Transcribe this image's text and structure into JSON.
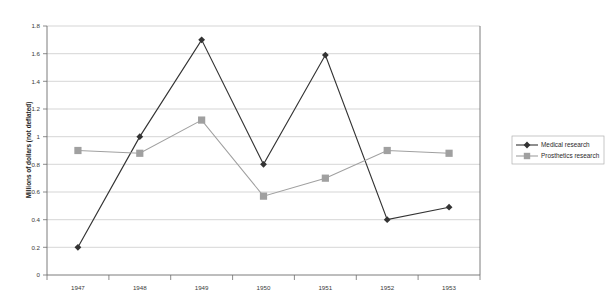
{
  "chart_data": {
    "type": "line",
    "title": "",
    "xlabel": "",
    "ylabel": "Millions of dollars (not deflated)",
    "categories": [
      "1947",
      "1948",
      "1949",
      "1950",
      "1951",
      "1952",
      "1953"
    ],
    "series": [
      {
        "name": "Medical research",
        "color": "#333333",
        "marker": "diamond",
        "values": [
          0.2,
          1.0,
          1.7,
          0.8,
          1.59,
          0.4,
          0.49
        ]
      },
      {
        "name": "Prosthetics research",
        "color": "#a0a0a0",
        "marker": "square",
        "values": [
          0.9,
          0.88,
          1.12,
          0.57,
          0.7,
          0.9,
          0.88
        ]
      }
    ],
    "ylim": [
      0,
      1.8
    ],
    "yticks": [
      "0",
      "0.2",
      "0.4",
      "0.6",
      "0.8",
      "1",
      "1.2",
      "1.4",
      "1.6",
      "1.8"
    ],
    "grid": true,
    "legend_position": "right"
  },
  "legend": {
    "items": [
      {
        "label": "Medical research"
      },
      {
        "label": "Prosthetics research"
      }
    ]
  },
  "axes": {
    "y_title": "Millions of dollars (not deflated)",
    "y_ticks": [
      "1.8",
      "1.6",
      "1.4",
      "1.2",
      "1",
      "0.8",
      "0.6",
      "0.4",
      "0.2",
      "0"
    ],
    "x_ticks": [
      "1947",
      "1948",
      "1949",
      "1950",
      "1951",
      "1952",
      "1953"
    ]
  }
}
